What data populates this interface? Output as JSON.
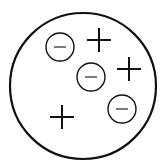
{
  "diagram": {
    "title": "",
    "colors": {
      "stroke": "#111111",
      "background": "#ffffff"
    },
    "container": {
      "cx": 83,
      "cy": 86,
      "r": 73
    },
    "charges": [
      {
        "type": "negative",
        "symbol": "−",
        "cx": 60,
        "cy": 47
      },
      {
        "type": "positive",
        "symbol": "+",
        "cx": 99,
        "cy": 40
      },
      {
        "type": "negative",
        "symbol": "−",
        "cx": 91,
        "cy": 77
      },
      {
        "type": "positive",
        "symbol": "+",
        "cx": 129,
        "cy": 69
      },
      {
        "type": "negative",
        "symbol": "−",
        "cx": 122,
        "cy": 109
      },
      {
        "type": "positive",
        "symbol": "+",
        "cx": 62,
        "cy": 117
      }
    ]
  }
}
